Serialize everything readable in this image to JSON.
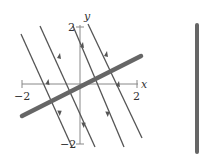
{
  "figure": {
    "type": "phase_portrait",
    "x_axis": {
      "label": "x",
      "ticks": [
        {
          "value": -2,
          "label": "−2"
        },
        {
          "value": 2,
          "label": "2"
        }
      ]
    },
    "y_axis": {
      "label": "y",
      "ticks": [
        {
          "value": 2,
          "label": "2"
        },
        {
          "value": -2,
          "label": "−2"
        }
      ]
    },
    "colors": {
      "trajectory": "#555555",
      "equilibrium_line": "#666666",
      "axis": "#777777"
    },
    "trajectories": [
      {
        "x1": 21,
        "y1": 34,
        "x2": 72,
        "y2": 147
      },
      {
        "x1": 40,
        "y1": 26,
        "x2": 95,
        "y2": 147
      },
      {
        "x1": 73,
        "y1": 26,
        "x2": 124,
        "y2": 147
      },
      {
        "x1": 88,
        "y1": 24,
        "x2": 142,
        "y2": 138
      }
    ],
    "equilibrium_line": {
      "x1": 22,
      "y1": 116,
      "x2": 141,
      "y2": 56
    },
    "phase_line": {
      "x": 197,
      "y1": 25,
      "y2": 152
    }
  }
}
